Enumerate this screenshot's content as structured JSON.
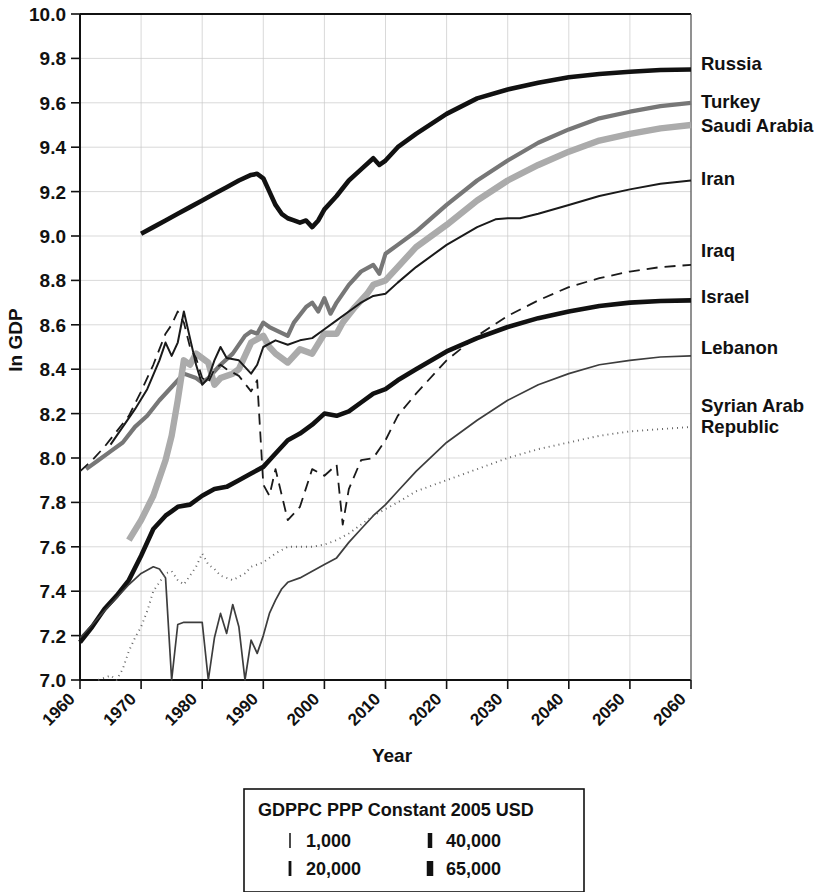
{
  "chart_data": {
    "type": "line",
    "title": "",
    "xlabel": "Year",
    "ylabel": "ln GDP",
    "xlim": [
      1960,
      2060
    ],
    "ylim": [
      7.0,
      10.0
    ],
    "grid": true,
    "legend_position": "right-outside",
    "xticks": [
      "1960",
      "1970",
      "1980",
      "1990",
      "2000",
      "2010",
      "2020",
      "2030",
      "2040",
      "2050",
      "2060"
    ],
    "yticks": [
      "10.0",
      "9.8",
      "9.6",
      "9.4",
      "9.2",
      "9.0",
      "8.8",
      "8.6",
      "8.4",
      "8.2",
      "8.0",
      "7.8",
      "7.6",
      "7.4",
      "7.2",
      "7.0"
    ],
    "series": [
      {
        "name": "Russia",
        "color": "#111111",
        "width": 4.6,
        "dash": "none",
        "x": [
          1970,
          1972,
          1974,
          1976,
          1978,
          1980,
          1982,
          1984,
          1986,
          1988,
          1989,
          1990,
          1991,
          1992,
          1993,
          1994,
          1995,
          1996,
          1997,
          1998,
          1999,
          2000,
          2002,
          2004,
          2006,
          2008,
          2009,
          2010,
          2012,
          2015,
          2020,
          2025,
          2030,
          2035,
          2040,
          2045,
          2050,
          2055,
          2060
        ],
        "values": [
          9.01,
          9.04,
          9.07,
          9.1,
          9.13,
          9.16,
          9.19,
          9.22,
          9.25,
          9.275,
          9.28,
          9.26,
          9.2,
          9.14,
          9.1,
          9.08,
          9.07,
          9.06,
          9.07,
          9.04,
          9.07,
          9.12,
          9.18,
          9.25,
          9.3,
          9.35,
          9.32,
          9.34,
          9.4,
          9.46,
          9.55,
          9.62,
          9.66,
          9.69,
          9.715,
          9.73,
          9.74,
          9.748,
          9.75
        ]
      },
      {
        "name": "Turkey",
        "color": "#777777",
        "width": 4.2,
        "dash": "none",
        "x": [
          1961,
          1963,
          1965,
          1967,
          1969,
          1971,
          1973,
          1975,
          1977,
          1979,
          1980,
          1981,
          1983,
          1985,
          1987,
          1988,
          1989,
          1990,
          1991,
          1994,
          1995,
          1997,
          1998,
          1999,
          2000,
          2001,
          2002,
          2004,
          2006,
          2008,
          2009,
          2010,
          2012,
          2015,
          2020,
          2025,
          2030,
          2035,
          2040,
          2045,
          2050,
          2055,
          2060
        ],
        "values": [
          7.95,
          7.99,
          8.03,
          8.07,
          8.14,
          8.19,
          8.26,
          8.32,
          8.38,
          8.36,
          8.34,
          8.36,
          8.42,
          8.47,
          8.55,
          8.57,
          8.56,
          8.61,
          8.59,
          8.55,
          8.61,
          8.68,
          8.7,
          8.66,
          8.72,
          8.65,
          8.7,
          8.78,
          8.84,
          8.87,
          8.83,
          8.92,
          8.96,
          9.02,
          9.14,
          9.25,
          9.34,
          9.42,
          9.48,
          9.53,
          9.56,
          9.585,
          9.6
        ]
      },
      {
        "name": "Saudi Arabia",
        "color": "#ababab",
        "width": 6.4,
        "dash": "none",
        "x": [
          1968,
          1970,
          1972,
          1974,
          1975,
          1976,
          1977,
          1978,
          1979,
          1980,
          1981,
          1982,
          1983,
          1985,
          1986,
          1987,
          1988,
          1990,
          1991,
          1992,
          1994,
          1996,
          1998,
          2000,
          2002,
          2003,
          2005,
          2007,
          2008,
          2010,
          2012,
          2015,
          2020,
          2025,
          2030,
          2035,
          2040,
          2045,
          2050,
          2055,
          2060
        ],
        "values": [
          7.63,
          7.72,
          7.83,
          7.99,
          8.1,
          8.26,
          8.44,
          8.42,
          8.47,
          8.45,
          8.43,
          8.33,
          8.36,
          8.38,
          8.4,
          8.46,
          8.52,
          8.55,
          8.5,
          8.47,
          8.43,
          8.49,
          8.47,
          8.56,
          8.56,
          8.61,
          8.68,
          8.74,
          8.78,
          8.8,
          8.86,
          8.95,
          9.05,
          9.16,
          9.25,
          9.32,
          9.38,
          9.43,
          9.46,
          9.485,
          9.5
        ]
      },
      {
        "name": "Iran",
        "color": "#1a1a1a",
        "width": 2.0,
        "dash": "none",
        "x": [
          1965,
          1967,
          1969,
          1971,
          1973,
          1974,
          1975,
          1976,
          1977,
          1978,
          1979,
          1980,
          1981,
          1982,
          1983,
          1984,
          1986,
          1988,
          1989,
          1990,
          1992,
          1994,
          1996,
          1998,
          2000,
          2002,
          2004,
          2006,
          2008,
          2010,
          2012,
          2015,
          2020,
          2025,
          2028,
          2030,
          2032,
          2035,
          2040,
          2045,
          2050,
          2055,
          2060
        ],
        "values": [
          8.06,
          8.14,
          8.22,
          8.31,
          8.44,
          8.52,
          8.46,
          8.52,
          8.66,
          8.54,
          8.42,
          8.33,
          8.36,
          8.44,
          8.5,
          8.45,
          8.44,
          8.38,
          8.42,
          8.5,
          8.53,
          8.51,
          8.53,
          8.54,
          8.58,
          8.62,
          8.66,
          8.7,
          8.73,
          8.74,
          8.79,
          8.86,
          8.96,
          9.04,
          9.075,
          9.08,
          9.08,
          9.1,
          9.14,
          9.18,
          9.21,
          9.235,
          9.25
        ]
      },
      {
        "name": "Iraq",
        "color": "#1a1a1a",
        "width": 1.8,
        "dash": "11 7",
        "x": [
          1960,
          1962,
          1964,
          1966,
          1968,
          1970,
          1972,
          1974,
          1975,
          1976,
          1977,
          1978,
          1979,
          1980,
          1981,
          1982,
          1983,
          1984,
          1986,
          1988,
          1989,
          1990,
          1991,
          1992,
          1994,
          1996,
          1998,
          2000,
          2002,
          2003,
          2004,
          2006,
          2008,
          2010,
          2012,
          2015,
          2020,
          2025,
          2030,
          2035,
          2040,
          2045,
          2050,
          2055,
          2060
        ],
        "values": [
          7.94,
          7.99,
          8.05,
          8.12,
          8.19,
          8.3,
          8.42,
          8.56,
          8.6,
          8.66,
          8.61,
          8.5,
          8.45,
          8.36,
          8.34,
          8.4,
          8.42,
          8.4,
          8.37,
          8.3,
          8.35,
          7.88,
          7.83,
          7.95,
          7.72,
          7.78,
          7.95,
          7.92,
          7.97,
          7.7,
          7.86,
          7.99,
          8.0,
          8.08,
          8.19,
          8.29,
          8.44,
          8.55,
          8.64,
          8.71,
          8.77,
          8.81,
          8.84,
          8.86,
          8.87
        ]
      },
      {
        "name": "Israel",
        "color": "#111111",
        "width": 4.6,
        "dash": "none",
        "x": [
          1960,
          1962,
          1964,
          1966,
          1968,
          1970,
          1972,
          1974,
          1975,
          1976,
          1978,
          1980,
          1982,
          1984,
          1986,
          1988,
          1990,
          1992,
          1994,
          1996,
          1998,
          2000,
          2002,
          2004,
          2006,
          2008,
          2010,
          2012,
          2015,
          2020,
          2025,
          2030,
          2035,
          2040,
          2045,
          2050,
          2055,
          2060
        ],
        "values": [
          7.17,
          7.24,
          7.32,
          7.38,
          7.45,
          7.56,
          7.68,
          7.74,
          7.76,
          7.78,
          7.79,
          7.83,
          7.86,
          7.87,
          7.9,
          7.93,
          7.96,
          8.02,
          8.08,
          8.11,
          8.15,
          8.2,
          8.19,
          8.21,
          8.25,
          8.29,
          8.31,
          8.35,
          8.4,
          8.48,
          8.54,
          8.59,
          8.63,
          8.66,
          8.685,
          8.7,
          8.707,
          8.71
        ]
      },
      {
        "name": "Lebanon",
        "color": "#3d3d3d",
        "width": 1.7,
        "dash": "none",
        "x": [
          1960,
          1962,
          1964,
          1966,
          1968,
          1970,
          1972,
          1973,
          1974,
          1975,
          1976,
          1977,
          1978,
          1979,
          1980,
          1981,
          1982,
          1983,
          1984,
          1985,
          1986,
          1987,
          1988,
          1989,
          1990,
          1991,
          1992,
          1993,
          1994,
          1996,
          1998,
          2000,
          2002,
          2004,
          2006,
          2008,
          2010,
          2012,
          2015,
          2020,
          2025,
          2030,
          2035,
          2040,
          2045,
          2050,
          2055,
          2060
        ],
        "values": [
          7.19,
          7.25,
          7.31,
          7.37,
          7.43,
          7.48,
          7.51,
          7.5,
          7.46,
          7.0,
          7.25,
          7.26,
          7.26,
          7.26,
          7.26,
          7.0,
          7.19,
          7.3,
          7.21,
          7.34,
          7.24,
          7.0,
          7.18,
          7.12,
          7.2,
          7.3,
          7.36,
          7.41,
          7.44,
          7.46,
          7.49,
          7.52,
          7.55,
          7.62,
          7.68,
          7.74,
          7.79,
          7.85,
          7.94,
          8.07,
          8.17,
          8.26,
          8.33,
          8.38,
          8.42,
          8.44,
          8.455,
          8.46
        ]
      },
      {
        "name": "Syrian Arab Republic",
        "color": "#666666",
        "width": 1.9,
        "dash": "1 4",
        "x": [
          1963,
          1965,
          1966,
          1967,
          1968,
          1969,
          1970,
          1971,
          1972,
          1974,
          1975,
          1976,
          1977,
          1978,
          1979,
          1980,
          1981,
          1982,
          1983,
          1985,
          1987,
          1988,
          1990,
          1992,
          1994,
          1996,
          1998,
          2000,
          2002,
          2004,
          2006,
          2008,
          2010,
          2012,
          2015,
          2020,
          2025,
          2030,
          2035,
          2040,
          2045,
          2050,
          2055,
          2060
        ],
        "values": [
          7.0,
          7.02,
          7.0,
          7.05,
          7.13,
          7.19,
          7.24,
          7.31,
          7.4,
          7.48,
          7.49,
          7.45,
          7.43,
          7.47,
          7.51,
          7.57,
          7.52,
          7.5,
          7.47,
          7.45,
          7.48,
          7.51,
          7.53,
          7.57,
          7.6,
          7.6,
          7.6,
          7.61,
          7.63,
          7.66,
          7.7,
          7.74,
          7.77,
          7.8,
          7.85,
          7.9,
          7.95,
          8.0,
          8.04,
          8.07,
          8.1,
          8.12,
          8.13,
          8.14
        ]
      }
    ]
  },
  "series_labels": [
    {
      "name": "Russia",
      "y": 9.75
    },
    {
      "name": "Turkey",
      "y": 9.6
    },
    {
      "name": "Saudi Arabia",
      "y": 9.5
    },
    {
      "name": "Iran",
      "y": 9.25
    },
    {
      "name": "Iraq",
      "y": 8.87
    },
    {
      "name": "Israel",
      "y": 8.71
    },
    {
      "name": "Lebanon",
      "y": 8.46
    },
    {
      "name": "Syrian Arab Republic",
      "y": 8.14
    }
  ],
  "legend": {
    "title": "GDPPC PPP Constant 2005 USD",
    "entries": [
      {
        "label": "1,000",
        "weight": 1.5,
        "column": 0
      },
      {
        "label": "20,000",
        "weight": 2.8,
        "column": 0
      },
      {
        "label": "40,000",
        "weight": 4.5,
        "column": 1
      },
      {
        "label": "65,000",
        "weight": 6.5,
        "column": 1
      }
    ]
  }
}
